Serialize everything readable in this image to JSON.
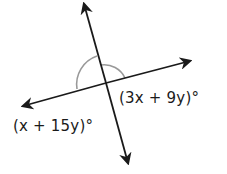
{
  "diagram": {
    "type": "intersecting-lines",
    "labels": {
      "angle_right": "(3x + 9y)°",
      "angle_left": "(x + 15y)°"
    },
    "colors": {
      "line": "#1a1a1a",
      "arc": "#999999",
      "background": "#ffffff"
    }
  }
}
